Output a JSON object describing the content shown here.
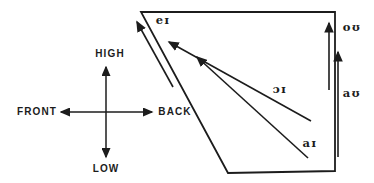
{
  "figure": {
    "kind": "vowel-diphthong-glide-diagram"
  },
  "colors": {
    "ink": "#1c1c1c",
    "background": "#ffffff"
  },
  "compass": {
    "high": "HIGH",
    "low": "LOW",
    "front": "FRONT",
    "back": "BACK"
  },
  "glides": {
    "ei": {
      "label": "eɪ",
      "direction": "up along front edge"
    },
    "ou": {
      "label": "oʊ",
      "direction": "up along back edge"
    },
    "oi": {
      "label": "ɔɪ",
      "direction": "low-back to high-front"
    },
    "au": {
      "label": "aʊ",
      "direction": "up along back edge"
    },
    "ai": {
      "label": "aɪ",
      "direction": "low-back to high-front"
    }
  }
}
